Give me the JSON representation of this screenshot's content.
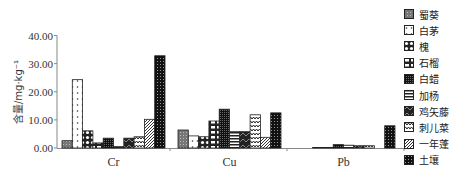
{
  "chart_data": {
    "type": "bar",
    "title": "",
    "xlabel": "",
    "ylabel": "含量/mg·kg⁻¹",
    "ylim": [
      0,
      40
    ],
    "yticks": [
      "0.00",
      "10.00",
      "20.00",
      "30.00",
      "40.00"
    ],
    "grid": false,
    "legend_position": "right",
    "categories": [
      "Cr",
      "Cu",
      "Pb"
    ],
    "series": [
      {
        "name": "蜀葵",
        "pattern": "grid",
        "values": [
          2.6,
          6.4,
          0.0
        ]
      },
      {
        "name": "白茅",
        "pattern": "dots",
        "values": [
          24.3,
          4.3,
          0.0
        ]
      },
      {
        "name": "槐",
        "pattern": "circles",
        "values": [
          6.1,
          4.0,
          0.2
        ]
      },
      {
        "name": "石榴",
        "pattern": "brick-open",
        "values": [
          1.8,
          9.6,
          0.2
        ]
      },
      {
        "name": "白蜡",
        "pattern": "dense-check",
        "values": [
          3.5,
          13.8,
          1.2
        ]
      },
      {
        "name": "加杨",
        "pattern": "hlines",
        "values": [
          0.5,
          5.8,
          1.0
        ]
      },
      {
        "name": "鸡矢藤",
        "pattern": "dark-waves",
        "values": [
          3.5,
          5.8,
          0.8
        ]
      },
      {
        "name": "刺儿菜",
        "pattern": "zigzag",
        "values": [
          4.0,
          11.8,
          0.8
        ]
      },
      {
        "name": "一年蓬",
        "pattern": "diagonal",
        "values": [
          10.2,
          3.8,
          0.0
        ]
      },
      {
        "name": "土壤",
        "pattern": "check",
        "values": [
          32.8,
          12.5,
          7.9
        ]
      }
    ]
  }
}
